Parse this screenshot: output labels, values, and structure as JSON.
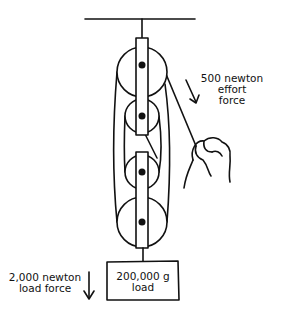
{
  "diagram": {
    "type": "block-and-tackle pulley system",
    "colors": {
      "stroke": "#111111",
      "background": "#ffffff"
    },
    "effort": {
      "line1": "500 newton",
      "line2": "effort",
      "line3": "force",
      "arrow_direction": "down-left"
    },
    "load_force": {
      "line1": "2,000 newton",
      "line2": "load force",
      "arrow_direction": "down"
    },
    "load": {
      "line1": "200,000 g",
      "line2": "load"
    },
    "pulleys": [
      {
        "block": "fixed",
        "size": "large"
      },
      {
        "block": "fixed",
        "size": "small"
      },
      {
        "block": "movable",
        "size": "small"
      },
      {
        "block": "movable",
        "size": "large"
      }
    ]
  }
}
